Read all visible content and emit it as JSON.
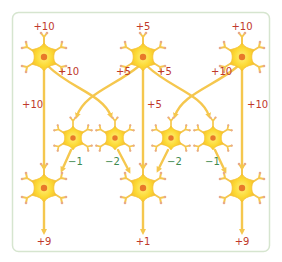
{
  "diagram": {
    "type": "neural-network-lateral-inhibition",
    "colors": {
      "frame": "#d6e5cf",
      "axon": "#f5c74e",
      "soma": "#fcd934",
      "soma_edge": "#f5b731",
      "nucleus": "#e8782a",
      "dendrite_tip": "#e8a98a",
      "positive_label": "#c0392b",
      "negative_label": "#3d8a4f"
    },
    "input_labels": [
      "+10",
      "+5",
      "+10"
    ],
    "cross_labels": [
      "+10",
      "+5",
      "+5",
      "+10"
    ],
    "direct_labels": [
      "+10",
      "+5",
      "+10"
    ],
    "inhibition_labels": [
      "−1",
      "−2",
      "−2",
      "−1"
    ],
    "output_labels": [
      "+9",
      "+1",
      "+9"
    ]
  }
}
